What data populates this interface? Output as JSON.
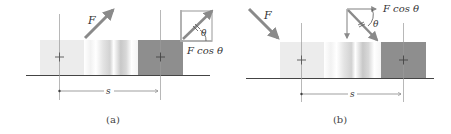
{
  "panels": [
    {
      "id": "a",
      "caption": "(a)",
      "force_label": "F",
      "component_label": "F cos θ",
      "angle_label": "θ",
      "displacement_label": "s",
      "force_direction": "up-right"
    },
    {
      "id": "b",
      "caption": "(b)",
      "force_label": "F",
      "component_label": "F cos θ",
      "angle_label": "θ",
      "displacement_label": "s",
      "force_direction": "down-right"
    }
  ],
  "colors": {
    "force_arrow": "#8a8a8a",
    "block_start": "#eeeeee",
    "block_end": "#8e8e8e",
    "ground": "#444444",
    "guide_line": "#999999",
    "text": "#333333"
  }
}
